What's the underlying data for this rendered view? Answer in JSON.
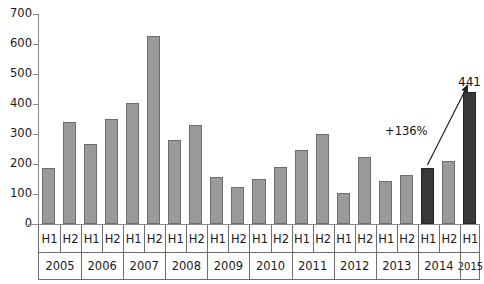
{
  "chart_data": {
    "type": "bar",
    "title": "",
    "subtitle": "",
    "xlabel": "",
    "ylabel": "",
    "ylim": [
      0,
      700
    ],
    "ytick_step": 100,
    "yticks": [
      0,
      100,
      200,
      300,
      400,
      500,
      600,
      700
    ],
    "grid": false,
    "legend": "none",
    "categories": [
      "H1",
      "H2",
      "H1",
      "H2",
      "H1",
      "H2",
      "H1",
      "H2",
      "H1",
      "H2",
      "H1",
      "H2",
      "H1",
      "H2",
      "H1",
      "H2",
      "H1",
      "H2",
      "H1",
      "H2",
      "H1"
    ],
    "group_labels": [
      {
        "label": "2005",
        "span": 2
      },
      {
        "label": "2006",
        "span": 2
      },
      {
        "label": "2007",
        "span": 2
      },
      {
        "label": "2008",
        "span": 2
      },
      {
        "label": "2009",
        "span": 2
      },
      {
        "label": "2010",
        "span": 2
      },
      {
        "label": "2011",
        "span": 2
      },
      {
        "label": "2012",
        "span": 2
      },
      {
        "label": "2013",
        "span": 2
      },
      {
        "label": "2014",
        "span": 2
      },
      {
        "label": "2015",
        "span": 1
      }
    ],
    "values": [
      188,
      341,
      266,
      350,
      403,
      627,
      280,
      331,
      158,
      122,
      150,
      191,
      247,
      300,
      105,
      222,
      143,
      163,
      187,
      211,
      441
    ],
    "bar_colors": [
      "light",
      "light",
      "light",
      "light",
      "light",
      "light",
      "light",
      "light",
      "light",
      "light",
      "light",
      "light",
      "light",
      "light",
      "light",
      "light",
      "light",
      "light",
      "dark",
      "light",
      "dark"
    ],
    "data_labels": [
      {
        "index": 20,
        "text": "441"
      }
    ],
    "annotations": [
      {
        "name": "growth-callout",
        "text": "+136%",
        "from_index": 18,
        "to_index": 20
      }
    ],
    "colors": {
      "bar_light": "#9a9a9a",
      "bar_light_border": "#6e6e6e",
      "bar_dark": "#383838",
      "bar_dark_border": "#242424",
      "axis": "#8a8a8a",
      "text": "#1a1a1a",
      "background": "#ffffff"
    }
  }
}
